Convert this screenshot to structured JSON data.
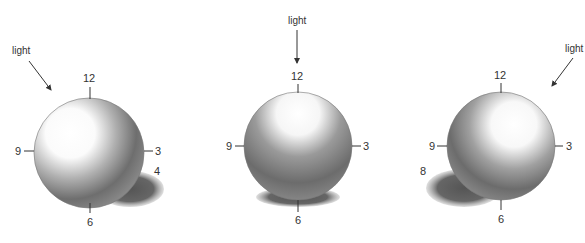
{
  "figure": {
    "panels": [
      {
        "id": "left",
        "light_label": "light",
        "light_direction": "upper-left",
        "clock_labels": {
          "top": "12",
          "right": "3",
          "bottom": "6",
          "left": "9"
        },
        "shadow_label": "4"
      },
      {
        "id": "center",
        "light_label": "light",
        "light_direction": "top",
        "clock_labels": {
          "top": "12",
          "right": "3",
          "bottom": "6",
          "left": "9"
        }
      },
      {
        "id": "right",
        "light_label": "light",
        "light_direction": "upper-right",
        "clock_labels": {
          "top": "12",
          "right": "3",
          "bottom": "6",
          "left": "9"
        },
        "shadow_label": "8"
      }
    ]
  }
}
